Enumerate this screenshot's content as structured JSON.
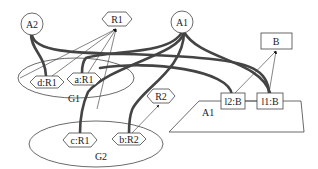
{
  "diagram": {
    "type": "graph",
    "nodes": {
      "A2": {
        "label": "A2",
        "shape": "circle"
      },
      "R1": {
        "label": "R1",
        "shape": "hexagon"
      },
      "A1_top": {
        "label": "A1",
        "shape": "circle"
      },
      "B": {
        "label": "B",
        "shape": "box"
      },
      "d_R1": {
        "label": "d:R1",
        "shape": "hexagon"
      },
      "a_R1": {
        "label": "a:R1",
        "shape": "hexagon"
      },
      "c_R1": {
        "label": "c:R1",
        "shape": "hexagon"
      },
      "b_R2": {
        "label": "b:R2",
        "shape": "hexagon"
      },
      "R2": {
        "label": "R2",
        "shape": "hexagon"
      },
      "l2_B": {
        "label": "l2:B",
        "shape": "box"
      },
      "l1_B": {
        "label": "l1:B",
        "shape": "box"
      }
    },
    "clusters": {
      "G1": {
        "label": "G1",
        "shape": "ellipse",
        "members": [
          "d:R1",
          "a:R1"
        ]
      },
      "G2": {
        "label": "G2",
        "shape": "ellipse",
        "members": [
          "c:R1",
          "b:R2"
        ]
      },
      "A1_region": {
        "label": "A1",
        "shape": "trapezoid",
        "members": [
          "l2:B",
          "l1:B"
        ]
      }
    },
    "edges": [
      {
        "from": "d:R1",
        "to": "R1",
        "style": "thin-arrow"
      },
      {
        "from": "a:R1",
        "to": "R1",
        "style": "thin-arrow"
      },
      {
        "from": "c:R1",
        "to": "R1",
        "style": "thin-arrow"
      },
      {
        "from": "G1",
        "to": "R1",
        "style": "thin-arrow"
      },
      {
        "from": "b:R2",
        "to": "R2",
        "style": "thin-arrow"
      },
      {
        "from": "l2:B",
        "to": "B",
        "style": "thin-arrow"
      },
      {
        "from": "l1:B",
        "to": "B",
        "style": "thin-arrow"
      },
      {
        "from": "l2:B",
        "to": "l1:B",
        "style": "thin-line"
      },
      {
        "from": "A2",
        "to": "d:R1",
        "style": "thick"
      },
      {
        "from": "A2",
        "to": "l1:B",
        "style": "thick"
      },
      {
        "from": "A1",
        "to": "a:R1",
        "style": "thick"
      },
      {
        "from": "A1",
        "to": "c:R1",
        "style": "thick"
      },
      {
        "from": "A1",
        "to": "b:R2",
        "style": "thick"
      },
      {
        "from": "A1",
        "to": "l1:B",
        "style": "thick"
      },
      {
        "from": "A1",
        "to": "l2:B",
        "style": "thick"
      },
      {
        "from": "G1",
        "to": "l2:B",
        "style": "thick"
      }
    ]
  }
}
